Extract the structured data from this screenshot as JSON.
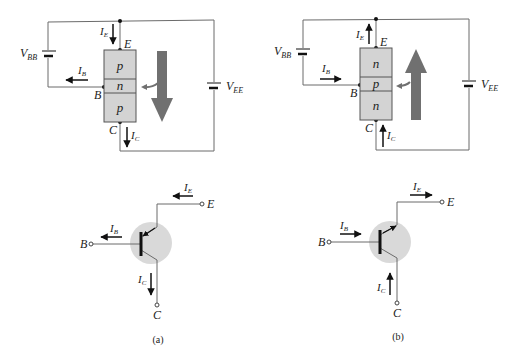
{
  "figure": {
    "panels": [
      {
        "id": "a",
        "caption": "(a)",
        "type": "pnp",
        "layers": [
          "p",
          "n",
          "p"
        ],
        "terminals": {
          "emitter": "E",
          "base": "B",
          "collector": "C"
        },
        "sources": {
          "base": "V",
          "base_sub": "BB",
          "emitter": "V",
          "emitter_sub": "EE"
        },
        "currents": {
          "ie": {
            "main": "I",
            "sub": "E",
            "direction": "down"
          },
          "ib": {
            "main": "I",
            "sub": "B",
            "direction": "left"
          },
          "ic": {
            "main": "I",
            "sub": "C",
            "direction": "down"
          }
        },
        "flow_arrow": "down"
      },
      {
        "id": "b",
        "caption": "(b)",
        "type": "npn",
        "layers": [
          "n",
          "p",
          "n"
        ],
        "terminals": {
          "emitter": "E",
          "base": "B",
          "collector": "C"
        },
        "sources": {
          "base": "V",
          "base_sub": "BB",
          "emitter": "V",
          "emitter_sub": "EE"
        },
        "currents": {
          "ie": {
            "main": "I",
            "sub": "E",
            "direction": "up"
          },
          "ib": {
            "main": "I",
            "sub": "B",
            "direction": "right"
          },
          "ic": {
            "main": "I",
            "sub": "C",
            "direction": "up"
          }
        },
        "flow_arrow": "up"
      }
    ],
    "colors": {
      "wire": "#6b6b6b",
      "block_fill": "#d3d3d3",
      "block_stroke": "#555555",
      "big_arrow": "#707070",
      "symbol_circle": "#d9d9d9",
      "arrow": "#111111"
    }
  }
}
